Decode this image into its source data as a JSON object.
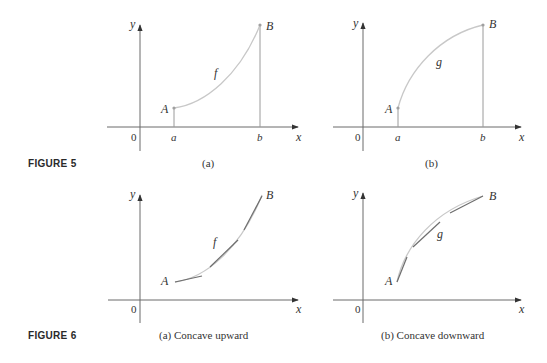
{
  "figures": [
    {
      "label": "FIGURE 5",
      "panels": [
        {
          "caption": "(a)",
          "function_label": "f",
          "axis_x_label": "x",
          "axis_y_label": "y",
          "origin_label": "0",
          "tick_a": "a",
          "tick_b": "b",
          "point_a_label": "A",
          "point_b_label": "B",
          "shape": "increasing, concave upward"
        },
        {
          "caption": "(b)",
          "function_label": "g",
          "axis_x_label": "x",
          "axis_y_label": "y",
          "origin_label": "0",
          "tick_a": "a",
          "tick_b": "b",
          "point_a_label": "A",
          "point_b_label": "B",
          "shape": "increasing, concave downward"
        }
      ]
    },
    {
      "label": "FIGURE 6",
      "panels": [
        {
          "caption": "(a) Concave upward",
          "function_label": "f",
          "axis_x_label": "x",
          "axis_y_label": "y",
          "origin_label": "0",
          "point_a_label": "A",
          "point_b_label": "B",
          "shape": "tangent segments lie below curve"
        },
        {
          "caption": "(b) Concave downward",
          "function_label": "g",
          "axis_x_label": "x",
          "axis_y_label": "y",
          "origin_label": "0",
          "point_a_label": "A",
          "point_b_label": "B",
          "shape": "tangent segments lie above curve"
        }
      ]
    }
  ],
  "colors": {
    "axis": "#6a6a6a",
    "curve": "#c8c8c8",
    "tangent": "#6e6e6e",
    "text": "#333333"
  }
}
